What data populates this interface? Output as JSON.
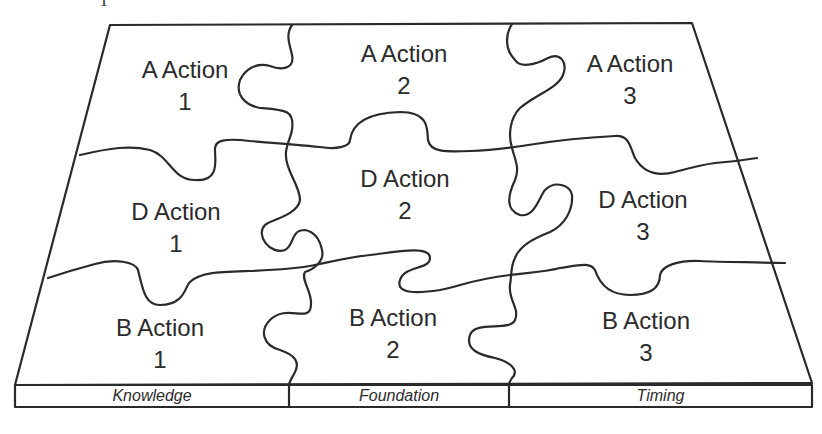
{
  "diagram": {
    "type": "jigsaw-puzzle-grid",
    "top_fragment": "I",
    "pieces": [
      {
        "row": "A",
        "col": 1,
        "title": "A Action",
        "number": "1"
      },
      {
        "row": "A",
        "col": 2,
        "title": "A Action",
        "number": "2"
      },
      {
        "row": "A",
        "col": 3,
        "title": "A Action",
        "number": "3"
      },
      {
        "row": "D",
        "col": 1,
        "title": "D Action",
        "number": "1"
      },
      {
        "row": "D",
        "col": 2,
        "title": "D Action",
        "number": "2"
      },
      {
        "row": "D",
        "col": 3,
        "title": "D Action",
        "number": "3"
      },
      {
        "row": "B",
        "col": 1,
        "title": "B Action",
        "number": "1"
      },
      {
        "row": "B",
        "col": 2,
        "title": "B Action",
        "number": "2"
      },
      {
        "row": "B",
        "col": 3,
        "title": "B Action",
        "number": "3"
      }
    ],
    "base_labels": [
      "Knowledge",
      "Foundation",
      "Timing"
    ],
    "colors": {
      "line": "#2a2a2a",
      "text": "#2b2b2b",
      "background": "#ffffff"
    }
  }
}
